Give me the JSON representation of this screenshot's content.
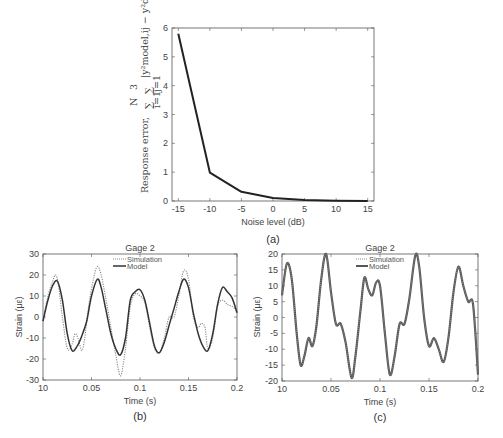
{
  "chart_data": [
    {
      "id": "a",
      "type": "line",
      "caption": "(a)",
      "title": "",
      "xlabel": "Noise level (dB)",
      "ylabel": "Response error, ∑_{i=1}^{N} ∑_{j=1}^{3} |y²_model,ij − y²_data,ij| ×10⁸",
      "ylabel_parts": {
        "prefix": "Response error,",
        "sum1": "∑",
        "sum1_top": "N",
        "sum1_bot": "i=1",
        "sum2": "∑",
        "sum2_top": "3",
        "sum2_bot": "j=1",
        "body": "|y²model,ij − y²data,ij|",
        "scale": "×10⁸"
      },
      "xlim": [
        -16,
        16
      ],
      "ylim": [
        0,
        6
      ],
      "xticks": [
        -15,
        -10,
        -5,
        0,
        5,
        10,
        15
      ],
      "yticks": [
        0,
        1,
        2,
        3,
        4,
        5,
        6
      ],
      "x": [
        -15,
        -10,
        -5,
        0,
        5,
        10,
        15
      ],
      "values": [
        5.8,
        0.98,
        0.32,
        0.1,
        0.03,
        0.01,
        0.0
      ],
      "line_color": "#222222",
      "grid": false
    },
    {
      "id": "b",
      "type": "line",
      "caption": "(b)",
      "title": "Gage 2",
      "xlabel": "Time (s)",
      "ylabel": "Strain (με)",
      "xlim": [
        0,
        0.2
      ],
      "ylim": [
        -30,
        30
      ],
      "xticks": [
        "10",
        "0.05",
        "0.1",
        "0.15",
        "0.2"
      ],
      "yticks": [
        -30,
        -20,
        -10,
        0,
        10,
        20,
        30
      ],
      "legend": [
        {
          "name": "Simulation",
          "style": "dotted"
        },
        {
          "name": "Model",
          "style": "solid"
        }
      ],
      "series": [
        {
          "name": "Simulation",
          "style": "dotted",
          "color": "#888888",
          "x": [
            0,
            0.005,
            0.01,
            0.013,
            0.016,
            0.02,
            0.025,
            0.03,
            0.033,
            0.036,
            0.04,
            0.043,
            0.047,
            0.052,
            0.056,
            0.06,
            0.065,
            0.07,
            0.075,
            0.08,
            0.085,
            0.09,
            0.095,
            0.1,
            0.105,
            0.11,
            0.115,
            0.12,
            0.125,
            0.13,
            0.135,
            0.14,
            0.145,
            0.15,
            0.155,
            0.16,
            0.163,
            0.167,
            0.17,
            0.175,
            0.18,
            0.185,
            0.19,
            0.195,
            0.2
          ],
          "values": [
            -2,
            10,
            17,
            20,
            15,
            0,
            -15,
            -13,
            -8,
            -10,
            -16,
            -10,
            5,
            18,
            24,
            20,
            8,
            -5,
            -18,
            -28,
            -15,
            5,
            11,
            10,
            7,
            -5,
            -15,
            -17,
            -10,
            0,
            0,
            10,
            22,
            18,
            0,
            -5,
            -3,
            -5,
            -15,
            -10,
            5,
            8,
            6,
            5,
            3
          ]
        },
        {
          "name": "Model",
          "style": "solid",
          "color": "#333333",
          "x": [
            0,
            0.005,
            0.01,
            0.015,
            0.02,
            0.025,
            0.03,
            0.035,
            0.04,
            0.045,
            0.05,
            0.056,
            0.06,
            0.065,
            0.07,
            0.075,
            0.08,
            0.085,
            0.09,
            0.095,
            0.1,
            0.105,
            0.11,
            0.115,
            0.12,
            0.125,
            0.13,
            0.135,
            0.14,
            0.145,
            0.15,
            0.155,
            0.16,
            0.165,
            0.17,
            0.175,
            0.18,
            0.185,
            0.19,
            0.195,
            0.2
          ],
          "values": [
            -2,
            8,
            15,
            17,
            8,
            -8,
            -16,
            -14,
            -9,
            -2,
            10,
            18,
            14,
            3,
            -8,
            -15,
            -18,
            -10,
            8,
            12,
            13,
            8,
            -3,
            -14,
            -17,
            -12,
            -4,
            4,
            12,
            18,
            14,
            2,
            -8,
            -14,
            -16,
            -8,
            6,
            14,
            12,
            9,
            2
          ]
        }
      ]
    },
    {
      "id": "c",
      "type": "line",
      "caption": "(c)",
      "title": "Gage 2",
      "xlabel": "Time (s)",
      "ylabel": "Strain (με)",
      "xlim": [
        0,
        0.2
      ],
      "ylim": [
        -20,
        20
      ],
      "xticks": [
        "10",
        "0.05",
        "0.1",
        "0.15",
        "0.2"
      ],
      "yticks": [
        -20,
        -15,
        -10,
        -5,
        0,
        5,
        10,
        15,
        20
      ],
      "legend": [
        {
          "name": "Simulation",
          "style": "dotted"
        },
        {
          "name": "Model",
          "style": "solid"
        }
      ],
      "series": [
        {
          "name": "Simulation",
          "style": "dotted",
          "color": "#777777",
          "x": [
            0,
            0.005,
            0.01,
            0.015,
            0.019,
            0.023,
            0.027,
            0.031,
            0.035,
            0.04,
            0.045,
            0.05,
            0.055,
            0.06,
            0.065,
            0.071,
            0.075,
            0.08,
            0.084,
            0.088,
            0.092,
            0.096,
            0.1,
            0.105,
            0.11,
            0.115,
            0.12,
            0.125,
            0.13,
            0.136,
            0.14,
            0.145,
            0.15,
            0.155,
            0.16,
            0.165,
            0.17,
            0.175,
            0.18,
            0.185,
            0.19,
            0.195,
            0.2
          ],
          "values": [
            7,
            17,
            12,
            -5,
            -15,
            -12,
            -6.5,
            -9,
            -3,
            12,
            20,
            8,
            -2,
            -2,
            -8,
            -19,
            -12,
            2,
            12.5,
            9,
            7,
            11,
            10,
            -5,
            -18,
            -12,
            -2,
            -2,
            6,
            19.5,
            16,
            0,
            -9,
            -6.5,
            -10,
            -14,
            -6,
            8,
            16,
            10,
            5,
            4,
            -18
          ]
        },
        {
          "name": "Model",
          "style": "solid",
          "color": "#555555",
          "x": [
            0,
            0.005,
            0.01,
            0.015,
            0.019,
            0.023,
            0.027,
            0.031,
            0.035,
            0.04,
            0.045,
            0.05,
            0.055,
            0.06,
            0.065,
            0.071,
            0.075,
            0.08,
            0.084,
            0.088,
            0.092,
            0.096,
            0.1,
            0.105,
            0.11,
            0.115,
            0.12,
            0.125,
            0.13,
            0.136,
            0.14,
            0.145,
            0.15,
            0.155,
            0.16,
            0.165,
            0.17,
            0.175,
            0.18,
            0.185,
            0.19,
            0.195,
            0.2
          ],
          "values": [
            7,
            17,
            12,
            -5,
            -15,
            -12,
            -6.5,
            -9,
            -3,
            12,
            20,
            8,
            -2,
            -2,
            -8,
            -19,
            -12,
            2,
            12.5,
            9,
            7,
            11,
            10,
            -5,
            -18,
            -12,
            -2,
            -2,
            6,
            19.5,
            16,
            0,
            -9,
            -6.5,
            -10,
            -14,
            -6,
            8,
            16,
            10,
            5,
            4,
            -18
          ]
        }
      ]
    }
  ]
}
